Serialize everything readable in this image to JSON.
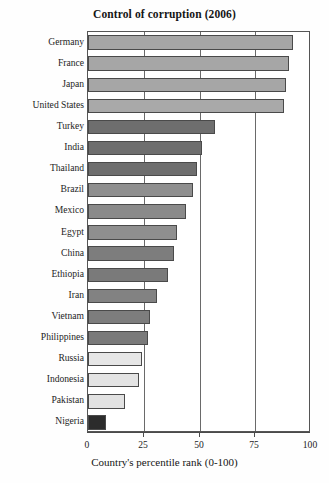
{
  "chart_data": {
    "type": "bar",
    "orientation": "horizontal",
    "title": "Control of corruption (2006)",
    "xlabel": "Country's percentile rank (0-100)",
    "ylabel": "",
    "xlim": [
      0,
      100
    ],
    "xticks": [
      0,
      25,
      50,
      75,
      100
    ],
    "xtick_labels": [
      "0",
      "25",
      "50",
      "75",
      "100"
    ],
    "grid": true,
    "grid_axis": "x",
    "legend": false,
    "categories": [
      "Germany",
      "France",
      "Japan",
      "United States",
      "Turkey",
      "India",
      "Thailand",
      "Brazil",
      "Mexico",
      "Egypt",
      "China",
      "Ethiopia",
      "Iran",
      "Vietnam",
      "Philippines",
      "Russia",
      "Indonesia",
      "Pakistan",
      "Nigeria"
    ],
    "values": [
      92,
      90,
      89,
      88,
      57,
      51,
      49,
      47,
      44,
      40,
      38.5,
      36,
      31,
      28,
      27,
      24,
      23,
      16.5,
      8
    ],
    "bar_colors": [
      "#a6a6a6",
      "#a6a6a6",
      "#a6a6a6",
      "#a9a9a9",
      "#6e6e6e",
      "#6e6e6e",
      "#6e6e6e",
      "#8f8f8f",
      "#8a8a8a",
      "#8f8f8f",
      "#7d7d7d",
      "#7a7a7a",
      "#828282",
      "#7d7d7d",
      "#7a7a7a",
      "#e6e6e6",
      "#e4e4e4",
      "#e2e2e2",
      "#2c2c2c"
    ]
  },
  "axis": {
    "frame_color": "#555555",
    "gridline_color": "#6a6a6a"
  }
}
